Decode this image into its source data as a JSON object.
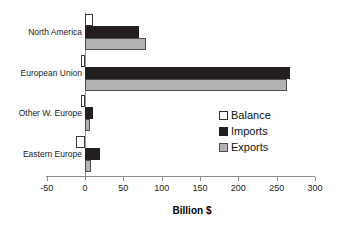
{
  "chart_data": {
    "type": "bar",
    "orientation": "horizontal",
    "title": "",
    "xlabel": "Billion $",
    "ylabel": "",
    "xlim": [
      -50,
      300
    ],
    "xticks": [
      -50,
      0,
      50,
      100,
      150,
      200,
      250,
      300
    ],
    "xtick_labels": [
      "-50",
      "0",
      "50",
      "100",
      "150",
      "200",
      "250",
      "300"
    ],
    "grid": false,
    "legend_position": "center-right",
    "categories": [
      "North America",
      "European Union",
      "Other W. Europe",
      "Eastern Europe"
    ],
    "series": [
      {
        "name": "Balance",
        "color": "#ffffff",
        "edge_color": "#3a3a3a",
        "values": [
          10,
          -5,
          -5,
          -12
        ]
      },
      {
        "name": "Imports",
        "color": "#231f20",
        "edge_color": "#231f20",
        "values": [
          70,
          268,
          11,
          20
        ]
      },
      {
        "name": "Exports",
        "color": "#b3b3b3",
        "edge_color": "#4d4d4d",
        "values": [
          80,
          263,
          6,
          8
        ]
      }
    ]
  },
  "legend": {
    "items": [
      {
        "label": "Balance",
        "swatch": "balance"
      },
      {
        "label": "Imports",
        "swatch": "imports"
      },
      {
        "label": "Exports",
        "swatch": "exports"
      }
    ]
  }
}
